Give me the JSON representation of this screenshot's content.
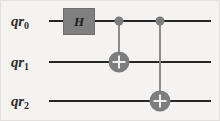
{
  "diagram": {
    "type": "quantum-circuit",
    "background_color": "#f4f3f1",
    "wire_color": "#262626",
    "gate_fill_color": "#808080",
    "control_color": "#7d7d7d",
    "target_plus_color": "#efefef"
  },
  "qubits": [
    {
      "id": "qr0",
      "register": "qr",
      "index": "0",
      "label_x": 10,
      "label_y": 20,
      "wire_y": 20,
      "wire_x_start": 48,
      "wire_x_end": 210
    },
    {
      "id": "qr1",
      "register": "qr",
      "index": "1",
      "label_x": 10,
      "label_y": 61,
      "wire_y": 61,
      "wire_x_start": 48,
      "wire_x_end": 210
    },
    {
      "id": "qr2",
      "register": "qr",
      "index": "2",
      "label_x": 10,
      "label_y": 100,
      "wire_y": 100,
      "wire_x_start": 48,
      "wire_x_end": 210
    }
  ],
  "gates": [
    {
      "id": "h-gate-qr0",
      "name": "hadamard-gate",
      "label": "H",
      "target_qubit": "qr0",
      "x": 62,
      "y": 7,
      "width": 32,
      "height": 27
    }
  ],
  "cnots": [
    {
      "id": "cnot-qr0-qr1",
      "name": "cnot-gate",
      "label": "CNOT",
      "control_qubit": "qr0",
      "target_qubit": "qr1",
      "x": 118,
      "control_y": 20,
      "target_y": 61,
      "dot_diameter": 9,
      "target_diameter": 21
    },
    {
      "id": "cnot-qr0-qr2",
      "name": "cnot-gate",
      "label": "CNOT",
      "control_qubit": "qr0",
      "target_qubit": "qr2",
      "x": 159,
      "control_y": 20,
      "target_y": 100,
      "dot_diameter": 9,
      "target_diameter": 21
    }
  ]
}
